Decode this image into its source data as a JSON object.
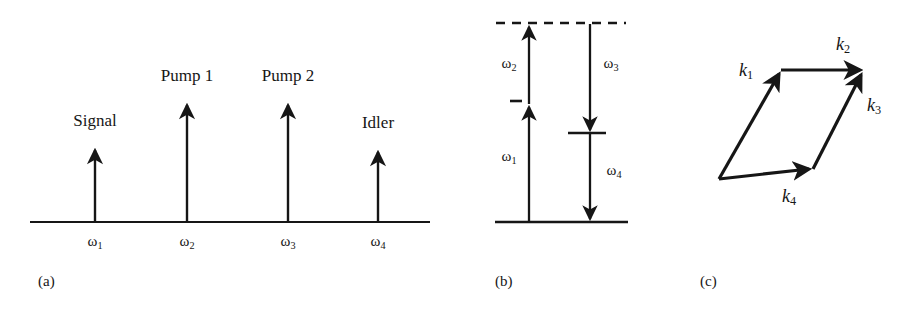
{
  "figure": {
    "panels": [
      {
        "id": "a",
        "caption": "(a)",
        "caption_x": 38,
        "caption_y": 274,
        "type": "spectrum",
        "baseline": {
          "x1": 30,
          "x2": 430,
          "y": 222
        },
        "lines": [
          {
            "name": "Signal",
            "label": "Signal",
            "x": 95,
            "tip_y": 146,
            "label_y": 112,
            "omega": "ω",
            "omega_sub": "1"
          },
          {
            "name": "Pump 1",
            "label": "Pump 1",
            "x": 187,
            "tip_y": 101,
            "label_y": 67,
            "omega": "ω",
            "omega_sub": "2"
          },
          {
            "name": "Pump 2",
            "label": "Pump 2",
            "x": 288,
            "tip_y": 101,
            "label_y": 67,
            "omega": "ω",
            "omega_sub": "3"
          },
          {
            "name": "Idler",
            "label": "Idler",
            "x": 378,
            "tip_y": 148,
            "label_y": 114,
            "omega": "ω",
            "omega_sub": "4"
          }
        ],
        "omega_label_y": 234
      },
      {
        "id": "b",
        "caption": "(b)",
        "caption_x": 495,
        "caption_y": 274,
        "type": "energy-level",
        "levels": [
          {
            "name": "virtual-top-level",
            "style": "dashed",
            "x1": 496,
            "x2": 626,
            "y": 23
          },
          {
            "name": "ground-level",
            "style": "solid",
            "x1": 495,
            "x2": 628,
            "y": 222
          },
          {
            "name": "intermediate-level-left",
            "style": "short-dash",
            "x1": 511,
            "x2": 521,
            "y": 101
          },
          {
            "name": "intermediate-level-right",
            "style": "short-solid",
            "x1": 568,
            "x2": 606,
            "y": 133
          }
        ],
        "transitions": [
          {
            "name": "omega1-up",
            "omega": "ω",
            "omega_sub": "1",
            "x": 529,
            "from_y": 222,
            "to_y": 104,
            "direction": "up",
            "label_x": 509,
            "label_y": 158
          },
          {
            "name": "omega2-up",
            "omega": "ω",
            "omega_sub": "2",
            "x": 529,
            "from_y": 104,
            "to_y": 24,
            "direction": "up",
            "label_x": 509,
            "label_y": 65
          },
          {
            "name": "omega3-down",
            "omega": "ω",
            "omega_sub": "3",
            "x": 590,
            "from_y": 24,
            "to_y": 133,
            "direction": "down",
            "label_x": 611,
            "label_y": 65
          },
          {
            "name": "omega4-down",
            "omega": "ω",
            "omega_sub": "4",
            "x": 590,
            "from_y": 133,
            "to_y": 222,
            "direction": "down",
            "label_x": 614,
            "label_y": 172
          }
        ]
      },
      {
        "id": "c",
        "caption": "(c)",
        "caption_x": 700,
        "caption_y": 274,
        "type": "vector-parallelogram",
        "vectors": [
          {
            "name": "k1",
            "symbol": "k",
            "sub": "1",
            "x1": 719,
            "y1": 179,
            "x2": 782,
            "y2": 70,
            "label_x": 746,
            "label_y": 71
          },
          {
            "name": "k2",
            "symbol": "k",
            "sub": "2",
            "x1": 782,
            "y1": 70,
            "x2": 864,
            "y2": 70,
            "label_x": 843,
            "label_y": 45
          },
          {
            "name": "k3",
            "symbol": "k",
            "sub": "3",
            "x1": 813,
            "y1": 169,
            "x2": 864,
            "y2": 70,
            "label_x": 874,
            "label_y": 106
          },
          {
            "name": "k4",
            "symbol": "k",
            "sub": "4",
            "x1": 719,
            "y1": 179,
            "x2": 813,
            "y2": 169,
            "label_x": 789,
            "label_y": 197
          }
        ]
      }
    ],
    "colors": {
      "ink": "#161616",
      "background": "#ffffff"
    }
  }
}
